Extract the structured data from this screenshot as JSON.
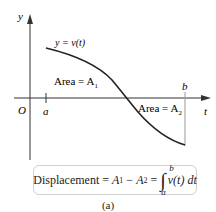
{
  "diagram": {
    "axis_labels": {
      "y": "y",
      "t": "t",
      "origin": "O"
    },
    "ticks": {
      "a": "a",
      "b": "b"
    },
    "curve_label": "y = v(t)",
    "regions": [
      {
        "id": "A1",
        "label": "Area = A",
        "sub": "1"
      },
      {
        "id": "A2",
        "label": "Area = A",
        "sub": "2"
      }
    ],
    "formula": {
      "lhs": "Displacement =",
      "a1": "A",
      "a1_sub": "1",
      "minus": "−",
      "a2": "A",
      "a2_sub": "2",
      "eq": "=",
      "integrand": "v(t) dt",
      "upper": "b",
      "lower": "a"
    },
    "caption": "(a)"
  }
}
